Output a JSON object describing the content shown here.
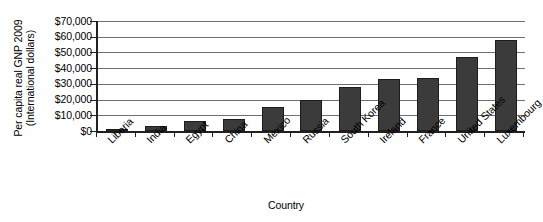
{
  "chart_data": {
    "type": "bar",
    "title": "",
    "xlabel": "Country",
    "ylabel": "Per capita real GNP 2009 (International dollars)",
    "ylabel_lines": [
      "Per capita real GNP 2009",
      "(International dollars)"
    ],
    "categories": [
      "Liberia",
      "India",
      "Egypt",
      "China",
      "Mexico",
      "Russia",
      "South Korea",
      "Ireland",
      "France",
      "United States",
      "Luxembourg"
    ],
    "values": [
      1000,
      3000,
      6500,
      7500,
      15000,
      19500,
      28000,
      33000,
      34000,
      47000,
      58000
    ],
    "ylim": [
      0,
      70000
    ],
    "yticks": [
      0,
      10000,
      20000,
      30000,
      40000,
      50000,
      60000,
      70000
    ],
    "ytick_labels": [
      "$0",
      "$10,000",
      "$20,000",
      "$30,000",
      "$40,000",
      "$50,000",
      "$60,000",
      "$70,000"
    ],
    "grid": true,
    "grid_axis": "y",
    "legend": false,
    "bar_color": "#3b3b3b",
    "axis_color": "#231f20",
    "grid_color": "#6f6f6f",
    "background": "#ffffff"
  }
}
